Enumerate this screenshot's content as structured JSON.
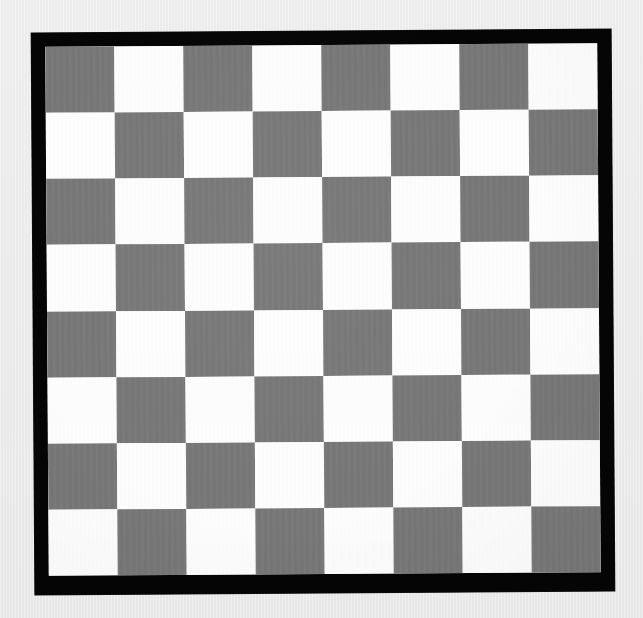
{
  "scene": {
    "title": "Checkerboard calibration target",
    "subject": "checkerboard",
    "background_color": "#ebebeb",
    "surface_description": "flat light gray wall"
  },
  "board": {
    "name": "camera-calibration-checkerboard",
    "frame_color": "#050505",
    "frame_thickness_px": 14,
    "rotation_degrees": -0.38,
    "bounds_px": {
      "x": 33,
      "y": 31,
      "width": 580,
      "height": 562
    },
    "inner_bounds_px": {
      "x": 47,
      "y": 45,
      "width": 552,
      "height": 529
    }
  },
  "grid": {
    "rows": 8,
    "columns": 8,
    "total_squares": 64,
    "square_width_px": 69,
    "square_height_px": 66,
    "light_color": "#fdfdfd",
    "dark_color": "#787878",
    "top_left_square": "dark",
    "pattern": [
      [
        "dark",
        "light",
        "dark",
        "light",
        "dark",
        "light",
        "dark",
        "light"
      ],
      [
        "light",
        "dark",
        "light",
        "dark",
        "light",
        "dark",
        "light",
        "dark"
      ],
      [
        "dark",
        "light",
        "dark",
        "light",
        "dark",
        "light",
        "dark",
        "light"
      ],
      [
        "light",
        "dark",
        "light",
        "dark",
        "light",
        "dark",
        "light",
        "dark"
      ],
      [
        "dark",
        "light",
        "dark",
        "light",
        "dark",
        "light",
        "dark",
        "light"
      ],
      [
        "light",
        "dark",
        "light",
        "dark",
        "light",
        "dark",
        "light",
        "dark"
      ],
      [
        "dark",
        "light",
        "dark",
        "light",
        "dark",
        "light",
        "dark",
        "light"
      ],
      [
        "light",
        "dark",
        "light",
        "dark",
        "light",
        "dark",
        "light",
        "dark"
      ]
    ]
  }
}
